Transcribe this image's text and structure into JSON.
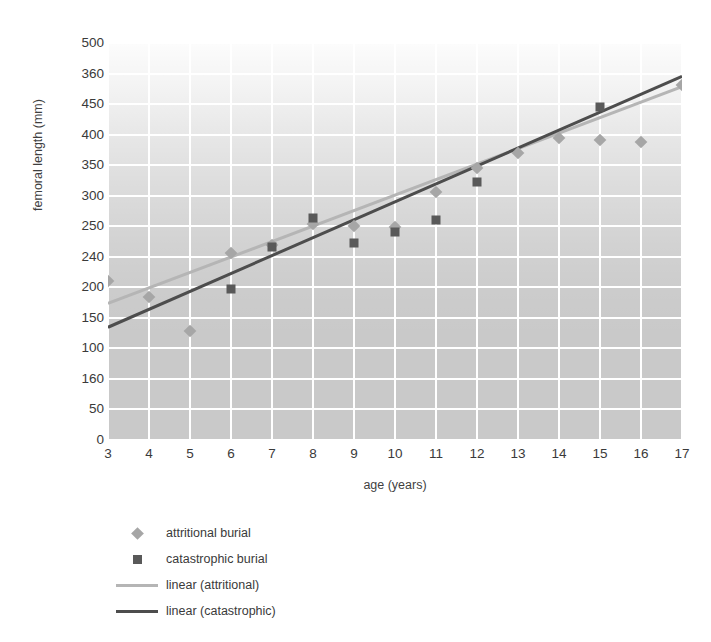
{
  "chart_data": {
    "type": "scatter",
    "title": "",
    "xlabel": "age (years)",
    "ylabel": "femoral length (mm)",
    "xlim": [
      3,
      17
    ],
    "ylim": [
      0,
      500
    ],
    "grid": true,
    "legend_position": "bottom-left",
    "x_tick_labels": [
      "3",
      "4",
      "5",
      "6",
      "7",
      "8",
      "9",
      "10",
      "11",
      "12",
      "13",
      "14",
      "15",
      "16",
      "17"
    ],
    "y_tick_labels": [
      "500",
      "360",
      "450",
      "400",
      "350",
      "300",
      "250",
      "240",
      "200",
      "150",
      "100",
      "160",
      "50",
      "0"
    ],
    "y_tick_values": [
      500,
      460,
      450,
      400,
      350,
      300,
      250,
      240,
      200,
      150,
      100,
      60,
      50,
      0
    ],
    "series": [
      {
        "name": "attritional burial",
        "marker": "diamond",
        "color": "#a6a6a6",
        "points": [
          {
            "x": 3,
            "y": 200
          },
          {
            "x": 4,
            "y": 180
          },
          {
            "x": 5,
            "y": 137
          },
          {
            "x": 6,
            "y": 236
          },
          {
            "x": 7,
            "y": 245
          },
          {
            "x": 8,
            "y": 272
          },
          {
            "x": 9,
            "y": 270
          },
          {
            "x": 10,
            "y": 268
          },
          {
            "x": 11,
            "y": 312
          },
          {
            "x": 12,
            "y": 343
          },
          {
            "x": 13,
            "y": 362
          },
          {
            "x": 14,
            "y": 380
          },
          {
            "x": 15,
            "y": 378
          },
          {
            "x": 16,
            "y": 375
          },
          {
            "x": 17,
            "y": 447
          }
        ]
      },
      {
        "name": "catastrophic burial",
        "marker": "square",
        "color": "#595959",
        "points": [
          {
            "x": 6,
            "y": 190
          },
          {
            "x": 7,
            "y": 243
          },
          {
            "x": 8,
            "y": 280
          },
          {
            "x": 9,
            "y": 248
          },
          {
            "x": 10,
            "y": 262
          },
          {
            "x": 11,
            "y": 277
          },
          {
            "x": 12,
            "y": 325
          },
          {
            "x": 15,
            "y": 420
          }
        ]
      }
    ],
    "trendlines": [
      {
        "name": "linear (attritional)",
        "color": "#b5b5b5",
        "x_start": 3,
        "y_start": 172,
        "x_end": 17,
        "y_end": 445
      },
      {
        "name": "linear (catastrophic)",
        "color": "#4d4d4d",
        "x_start": 3,
        "y_start": 142,
        "x_end": 17,
        "y_end": 458
      }
    ],
    "legend_entries": [
      {
        "label": "attritional burial",
        "key": "diamond-marker",
        "color": "#a6a6a6"
      },
      {
        "label": "catastrophic burial",
        "key": "square-marker",
        "color": "#595959"
      },
      {
        "label": "linear (attritional)",
        "key": "line-light",
        "color": "#b5b5b5"
      },
      {
        "label": "linear (catastrophic)",
        "key": "line-dark",
        "color": "#4d4d4d"
      }
    ]
  }
}
